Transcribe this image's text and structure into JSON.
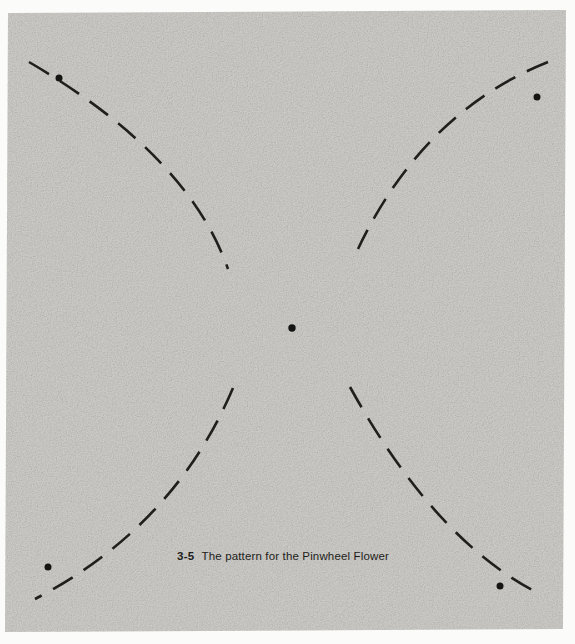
{
  "page": {
    "background_color": "#fbfbf9",
    "panel_color": "#cac9c5",
    "ink_color": "#1f1f1d",
    "dot_color": "#151513"
  },
  "figure": {
    "caption_number": "3-5",
    "caption_text": "The pattern for the Pinwheel Flower"
  },
  "pattern": {
    "panel_corners": [
      [
        8,
        13
      ],
      [
        566,
        10
      ],
      [
        563,
        629
      ],
      [
        5,
        632
      ]
    ],
    "dash_pattern": "23 13",
    "stroke_width": 2.6,
    "arcs": [
      {
        "name": "top-left-arc",
        "start": [
          29,
          62
        ],
        "control": [
          188,
          155
        ],
        "end": [
          228,
          269
        ]
      },
      {
        "name": "top-right-arc",
        "start": [
          548,
          62
        ],
        "control": [
          423,
          112
        ],
        "end": [
          358,
          249
        ]
      },
      {
        "name": "bottom-left-arc",
        "start": [
          233,
          388
        ],
        "control": [
          174,
          527
        ],
        "end": [
          35,
          599
        ]
      },
      {
        "name": "bottom-right-arc",
        "start": [
          350,
          387
        ],
        "control": [
          436,
          543
        ],
        "end": [
          542,
          595
        ]
      }
    ],
    "dots": [
      {
        "name": "center-dot",
        "x": 292,
        "y": 328,
        "r": 3.7
      },
      {
        "name": "top-left-dot",
        "x": 59,
        "y": 78,
        "r": 3.5
      },
      {
        "name": "top-right-dot",
        "x": 537,
        "y": 97,
        "r": 3.5
      },
      {
        "name": "bottom-left-dot",
        "x": 48,
        "y": 567,
        "r": 3.5
      },
      {
        "name": "bottom-right-dot",
        "x": 500,
        "y": 586,
        "r": 3.5
      }
    ]
  }
}
